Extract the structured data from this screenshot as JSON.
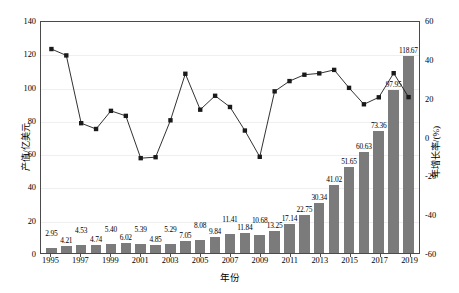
{
  "chart_data": {
    "type": "bar",
    "title": "",
    "xlabel": "年份",
    "ylabel": "产值/亿美元",
    "ylabel_right": "年增长率/(%)",
    "ylim": [
      0,
      140
    ],
    "ylim_right": [
      -60,
      60
    ],
    "yticks": [
      0,
      20,
      40,
      60,
      80,
      100,
      120,
      140
    ],
    "yticks_right": [
      -60,
      -40,
      -20,
      0,
      20,
      40,
      60
    ],
    "grid": true,
    "legend": "none",
    "categories": [
      "1995",
      "1996",
      "1997",
      "1998",
      "1999",
      "2000",
      "2001",
      "2002",
      "2003",
      "2004",
      "2005",
      "2006",
      "2007",
      "2008",
      "2009",
      "2010",
      "2011",
      "2012",
      "2013",
      "2014",
      "2015",
      "2016",
      "2017",
      "2018",
      "2019"
    ],
    "xtick_labels": [
      "1995",
      "1997",
      "1999",
      "2001",
      "2003",
      "2005",
      "2007",
      "2009",
      "2011",
      "2013",
      "2015",
      "2017",
      "2019"
    ],
    "series": [
      {
        "name": "产值/亿美元",
        "type": "bar",
        "axis": "left",
        "color": "#7b7b7b",
        "values": [
          2.95,
          4.21,
          4.53,
          4.74,
          5.4,
          6.02,
          5.39,
          4.85,
          5.29,
          7.05,
          8.08,
          9.84,
          11.41,
          11.84,
          10.68,
          13.25,
          17.14,
          22.75,
          30.34,
          41.02,
          51.65,
          60.63,
          73.36,
          97.95,
          118.67
        ],
        "labels": [
          "2.95",
          "4.21",
          "4.53",
          "4.74",
          "5.40",
          "6.02",
          "5.39",
          "4.85",
          "5.29",
          "7.05",
          "8.08",
          "9.84",
          "11.41",
          "11.84",
          "10.68",
          "13.25",
          "17.14",
          "22.75",
          "30.34",
          "41.02",
          "51.65",
          "60.63",
          "73.36",
          "97.95",
          "118.67"
        ]
      },
      {
        "name": "年增长率/(%)",
        "type": "line",
        "axis": "right",
        "color": "#1a1a1a",
        "marker": "square",
        "values": [
          46.0,
          42.7,
          7.6,
          4.6,
          14.0,
          11.4,
          -10.5,
          -10.0,
          9.1,
          33.2,
          14.6,
          21.8,
          16.0,
          3.8,
          -9.8,
          24.1,
          29.4,
          32.7,
          33.4,
          35.2,
          25.9,
          17.4,
          21.0,
          33.5,
          21.1
        ]
      }
    ]
  },
  "axes": {
    "left_title": "产值/亿美元",
    "right_title": "年增长率/(%)",
    "bottom_title": "年份"
  }
}
